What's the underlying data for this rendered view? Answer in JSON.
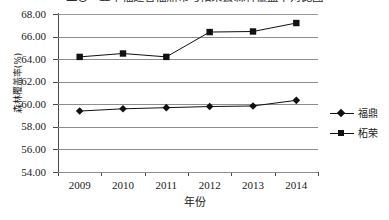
{
  "top_clipped_text": "二〇一五年福建省福鼎市与柘荣县森林覆盖率对比图",
  "chart_data": {
    "type": "line",
    "title": "",
    "xlabel": "年份",
    "ylabel": "森林覆盖率(%)",
    "categories": [
      "2009",
      "2010",
      "2011",
      "2012",
      "2013",
      "2014"
    ],
    "ylim": [
      54.0,
      68.0
    ],
    "ytick_labels": [
      "68.00",
      "66.00",
      "64.00",
      "62.00",
      "60.00",
      "58.00",
      "56.00",
      "54.00"
    ],
    "ytick_values": [
      68.0,
      66.0,
      64.0,
      62.0,
      60.0,
      58.0,
      56.0,
      54.0
    ],
    "grid": "horizontal",
    "legend_position": "right",
    "series": [
      {
        "name": "福鼎",
        "marker": "diamond",
        "color": "#111111",
        "values": [
          59.4,
          59.6,
          59.7,
          59.8,
          59.85,
          60.35
        ]
      },
      {
        "name": "柘荣",
        "marker": "square",
        "color": "#111111",
        "values": [
          64.2,
          64.5,
          64.2,
          66.4,
          66.45,
          67.2
        ]
      }
    ]
  },
  "legend": {
    "items": [
      {
        "label": "福鼎",
        "marker": "diamond"
      },
      {
        "label": "柘荣",
        "marker": "square"
      }
    ]
  }
}
